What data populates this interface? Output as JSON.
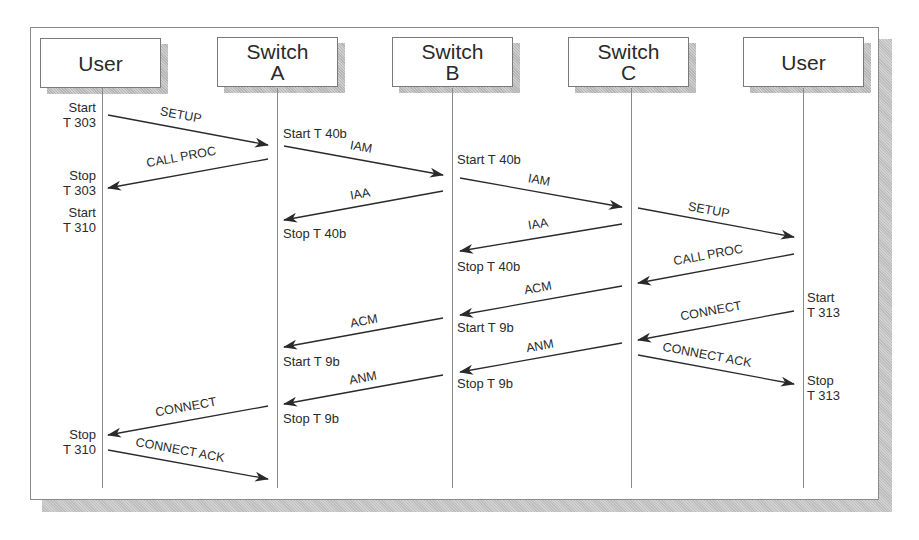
{
  "diagram": {
    "type": "sequence-diagram",
    "participants": [
      {
        "id": "user_left",
        "line1": "User",
        "line2": ""
      },
      {
        "id": "switch_a",
        "line1": "Switch",
        "line2": "A"
      },
      {
        "id": "switch_b",
        "line1": "Switch",
        "line2": "B"
      },
      {
        "id": "switch_c",
        "line1": "Switch",
        "line2": "C"
      },
      {
        "id": "user_right",
        "line1": "User",
        "line2": ""
      }
    ],
    "messages": [
      {
        "label": "SETUP",
        "from": "user_left",
        "to": "switch_a"
      },
      {
        "label": "CALL PROC",
        "from": "switch_a",
        "to": "user_left"
      },
      {
        "label": "IAM",
        "from": "switch_a",
        "to": "switch_b"
      },
      {
        "label": "IAA",
        "from": "switch_b",
        "to": "switch_a"
      },
      {
        "label": "IAM",
        "from": "switch_b",
        "to": "switch_c"
      },
      {
        "label": "IAA",
        "from": "switch_c",
        "to": "switch_b"
      },
      {
        "label": "SETUP",
        "from": "switch_c",
        "to": "user_right"
      },
      {
        "label": "CALL PROC",
        "from": "user_right",
        "to": "switch_c"
      },
      {
        "label": "ACM",
        "from": "switch_c",
        "to": "switch_b"
      },
      {
        "label": "CONNECT",
        "from": "user_right",
        "to": "switch_c"
      },
      {
        "label": "ACM",
        "from": "switch_b",
        "to": "switch_a"
      },
      {
        "label": "ANM",
        "from": "switch_c",
        "to": "switch_b"
      },
      {
        "label": "CONNECT ACK",
        "from": "switch_c",
        "to": "user_right"
      },
      {
        "label": "ANM",
        "from": "switch_b",
        "to": "switch_a"
      },
      {
        "label": "CONNECT",
        "from": "switch_a",
        "to": "user_left"
      },
      {
        "label": "CONNECT ACK",
        "from": "user_left",
        "to": "switch_a"
      }
    ],
    "timer_notes": {
      "user_left_start_t303": {
        "line1": "Start",
        "line2": "T 303"
      },
      "user_left_stop_t303": {
        "line1": "Stop",
        "line2": "T 303"
      },
      "user_left_start_t310": {
        "line1": "Start",
        "line2": "T 310"
      },
      "user_left_stop_t310": {
        "line1": "Stop",
        "line2": "T 310"
      },
      "switch_a_start_t40b": "Start T 40b",
      "switch_a_stop_t40b": "Stop T 40b",
      "switch_a_start_t9b": "Start T 9b",
      "switch_a_stop_t9b": "Stop T 9b",
      "switch_b_start_t40b": "Start T 40b",
      "switch_b_stop_t40b": "Stop T 40b",
      "switch_b_start_t9b": "Start T 9b",
      "switch_b_stop_t9b": "Stop T 9b",
      "user_right_start_t313": {
        "line1": "Start",
        "line2": "T 313"
      },
      "user_right_stop_t313": {
        "line1": "Stop",
        "line2": "T 313"
      }
    }
  }
}
